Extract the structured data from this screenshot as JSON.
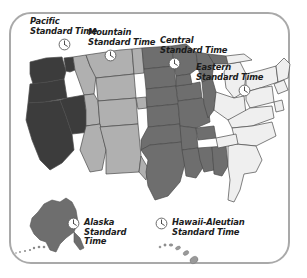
{
  "figure": {
    "background_color": "#ffffff",
    "frame_color": "#a9a9a9"
  },
  "zones": [
    {
      "id": "pacific",
      "name": "Pacific",
      "line1": "Pacific",
      "line2": "Standard Time",
      "fill_color": "#3c3c3c",
      "clock_icon": "clock-icon"
    },
    {
      "id": "mountain",
      "name": "Mountain",
      "line1": "Mountain",
      "line2": "Standard Time",
      "fill_color": "#b0b0b0",
      "clock_icon": "clock-icon"
    },
    {
      "id": "central",
      "name": "Central",
      "line1": "Central",
      "line2": "Standard Time",
      "fill_color": "#6e6e6e",
      "clock_icon": "clock-icon"
    },
    {
      "id": "eastern",
      "name": "Eastern",
      "line1": "Eastern",
      "line2": "Standard Time",
      "fill_color": "#efefef",
      "clock_icon": "clock-icon"
    },
    {
      "id": "alaska",
      "name": "Alaska",
      "line1": "Alaska",
      "line2": "Standard",
      "line3": "Time",
      "fill_color": "#6e6e6e",
      "clock_icon": "clock-icon"
    },
    {
      "id": "hawaii_aleutian",
      "name": "Hawaii-Aleutian",
      "line1": "Hawaii-Aleutian",
      "line2": "Standard Time",
      "fill_color": "#9a9a9a",
      "clock_icon": "clock-icon"
    }
  ],
  "map": {
    "state_outline_color": "#4a4a4a",
    "coast_outline_color": "#555555",
    "aleutian_chain_style": "dotted"
  }
}
